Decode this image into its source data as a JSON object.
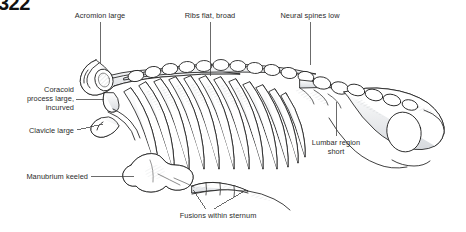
{
  "figure": {
    "page_mark": "322",
    "ink_color": "#1d1d1d",
    "bone_fill": "#ffffff",
    "shade_color": "#b9bcc0",
    "leader_color": "#3a3a3a",
    "text_color": "#2b2b2b"
  },
  "labels": [
    {
      "id": "acromion",
      "text": "Acromion large",
      "align": "center",
      "x": 48,
      "y": 11,
      "w": 104,
      "leader": {
        "x1": 100,
        "y1": 22,
        "x2": 100,
        "y2": 63
      }
    },
    {
      "id": "ribs",
      "text": "Ribs flat, broad",
      "align": "center",
      "x": 162,
      "y": 11,
      "w": 96,
      "leader": {
        "x1": 210,
        "y1": 22,
        "x2": 210,
        "y2": 76
      }
    },
    {
      "id": "neural-spines",
      "text": "Neural spines low",
      "align": "center",
      "x": 258,
      "y": 11,
      "w": 104,
      "leader": {
        "x1": 310,
        "y1": 22,
        "x2": 310,
        "y2": 65
      }
    },
    {
      "id": "coracoid",
      "text": "Coracoid\nprocess large,\nincurved",
      "align": "right",
      "x": 6,
      "y": 85,
      "w": 68,
      "leader": {
        "x1": 76,
        "y1": 99,
        "x2": 104,
        "y2": 99
      }
    },
    {
      "id": "clavicle",
      "text": "Clavicle large",
      "align": "right",
      "x": 6,
      "y": 126,
      "w": 68,
      "leader": {
        "x1": 77,
        "y1": 130,
        "x2": 102,
        "y2": 124
      }
    },
    {
      "id": "manubrium",
      "text": "Manubrium keeled",
      "align": "right",
      "x": 2,
      "y": 172,
      "w": 86,
      "leader": {
        "x1": 91,
        "y1": 176,
        "x2": 134,
        "y2": 176
      }
    },
    {
      "id": "lumbar",
      "text": "Lumbar region\nshort",
      "align": "center",
      "x": 294,
      "y": 138,
      "w": 84,
      "leader": {
        "x1": 336,
        "y1": 136,
        "x2": 336,
        "y2": 102
      }
    },
    {
      "id": "fusions",
      "text": "Fusions within sternum",
      "align": "center",
      "x": 160,
      "y": 211,
      "w": 116,
      "leader_a": {
        "x1": 206,
        "y1": 210,
        "x2": 193,
        "y2": 190
      },
      "leader_b": {
        "x1": 214,
        "y1": 210,
        "x2": 244,
        "y2": 190
      }
    }
  ]
}
